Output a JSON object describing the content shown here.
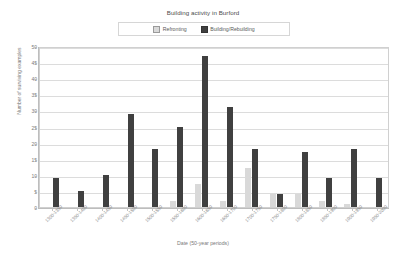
{
  "chart_data": {
    "type": "bar",
    "title": "Building activity in Burford",
    "xlabel": "Date (50-year periods)",
    "ylabel": "Number of surviving examples",
    "ylim": [
      0,
      50
    ],
    "ytick_step": 5,
    "yticks": [
      "0",
      "5",
      "10",
      "15",
      "20",
      "25",
      "30",
      "35",
      "40",
      "45",
      "50"
    ],
    "grid": true,
    "legend_position": "top-center",
    "categories": [
      "1300-1350",
      "1350-1400",
      "1400-1450",
      "1450-1500",
      "1500-1550",
      "1550-1600",
      "1600-1650",
      "1650-1700",
      "1700-1750",
      "1750-1800",
      "1800-1850",
      "1850-1900",
      "1900-1950",
      "1950-2000"
    ],
    "series": [
      {
        "name": "Refronting",
        "color": "#d9d9d9",
        "values": [
          0,
          0,
          0,
          0,
          0,
          2,
          7,
          2,
          12,
          4,
          4,
          2,
          1,
          0
        ]
      },
      {
        "name": "Building/Rebuilding",
        "color": "#404040",
        "values": [
          9,
          5,
          10,
          29,
          18,
          25,
          47,
          31,
          18,
          4,
          17,
          9,
          18,
          9
        ]
      }
    ]
  },
  "legend": {
    "items": [
      {
        "label": "Refronting",
        "swatch": "light"
      },
      {
        "label": "Building/Rebuilding",
        "swatch": "dark"
      }
    ]
  }
}
